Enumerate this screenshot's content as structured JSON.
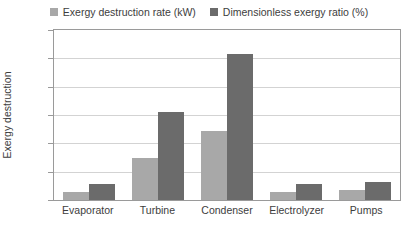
{
  "chart_data": {
    "type": "bar",
    "title": "",
    "xlabel": "",
    "ylabel": "Exergy destruction",
    "ylim": [
      0,
      60
    ],
    "yticks": [
      0,
      10,
      20,
      30,
      40,
      50,
      60
    ],
    "grid": true,
    "legend_position": "top-center",
    "categories": [
      "Evaporator",
      "Turbine",
      "Condenser",
      "Electrolyzer",
      "Pumps"
    ],
    "series": [
      {
        "name": "Exergy destruction rate (kW)",
        "color": "#a8a8a8",
        "values": [
          3.0,
          15.0,
          24.5,
          3.0,
          3.5
        ]
      },
      {
        "name": "Dimensionless exergy ratio (%)",
        "color": "#6b6b6b",
        "values": [
          5.5,
          31.0,
          51.5,
          5.5,
          6.5
        ]
      }
    ]
  },
  "axis": {
    "y_title": "Exergy destruction",
    "tick_labels": [
      "60",
      "50",
      "40",
      "30",
      "20",
      "10",
      "0"
    ]
  },
  "legend": {
    "items": [
      {
        "label": "Exergy destruction rate (kW)",
        "swatch": "legend-swatch-light"
      },
      {
        "label": "Dimensionless exergy ratio (%)",
        "swatch": "legend-swatch-dark"
      }
    ]
  }
}
